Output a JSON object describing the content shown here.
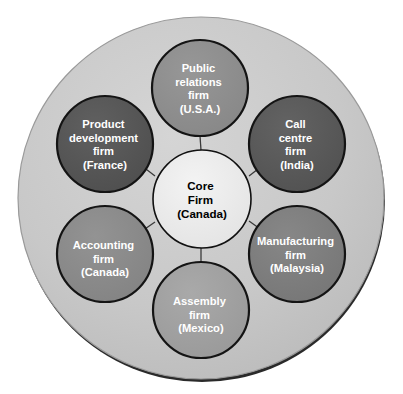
{
  "diagram": {
    "type": "hub-and-spoke-network",
    "background_color": "#ffffff",
    "outer_ring": {
      "label": "outer-boundary",
      "fill": "#c6c6c6",
      "stroke": "#1a1a1a",
      "cx": 201,
      "cy": 198,
      "r": 183
    },
    "core": {
      "id": "core-firm",
      "lines": [
        "Core",
        "Firm",
        "(Canada)"
      ],
      "fill": "#ececec",
      "stroke": "#111111",
      "text_color": "#000000",
      "cx": 202,
      "cy": 199,
      "r": 49
    },
    "satellites": [
      {
        "id": "public-relations-firm",
        "lines": [
          "Public",
          "relations",
          "firm",
          "(U.S.A.)"
        ],
        "fill": "#8e8e8e",
        "stroke": "#111111",
        "text_color": "#ffffff",
        "cx": 200,
        "cy": 88,
        "r": 48
      },
      {
        "id": "call-centre-firm",
        "lines": [
          "Call",
          "centre",
          "firm",
          "(India)"
        ],
        "fill": "#595959",
        "stroke": "#111111",
        "text_color": "#ffffff",
        "cx": 297,
        "cy": 144,
        "r": 48
      },
      {
        "id": "manufacturing-firm",
        "lines": [
          "Manufacturing",
          "firm",
          "(Malaysia)"
        ],
        "fill": "#7d7d7d",
        "stroke": "#111111",
        "text_color": "#ffffff",
        "cx": 297,
        "cy": 254,
        "r": 48
      },
      {
        "id": "assembly-firm",
        "lines": [
          "Assembly",
          "firm",
          "(Mexico)"
        ],
        "fill": "#a0a0a0",
        "stroke": "#111111",
        "text_color": "#ffffff",
        "cx": 201,
        "cy": 310,
        "r": 48
      },
      {
        "id": "accounting-firm",
        "lines": [
          "Accounting",
          "firm",
          "(Canada)"
        ],
        "fill": "#8a8a8a",
        "stroke": "#111111",
        "text_color": "#ffffff",
        "cx": 105,
        "cy": 254,
        "r": 48
      },
      {
        "id": "product-development-firm",
        "lines": [
          "Product",
          "development",
          "firm",
          "(France)"
        ],
        "fill": "#565656",
        "stroke": "#111111",
        "text_color": "#ffffff",
        "cx": 105,
        "cy": 144,
        "r": 48
      }
    ],
    "connectors": [
      {
        "id": "connector-core-public-relations",
        "x1": 200,
        "y1": 136,
        "x2": 201,
        "y2": 150
      },
      {
        "id": "connector-core-call-centre",
        "x1": 262,
        "y1": 166,
        "x2": 249,
        "y2": 176
      },
      {
        "id": "connector-core-manufacturing",
        "x1": 249,
        "y1": 221,
        "x2": 263,
        "y2": 231
      },
      {
        "id": "connector-core-assembly",
        "x1": 201,
        "y1": 248,
        "x2": 201,
        "y2": 262
      },
      {
        "id": "connector-core-accounting",
        "x1": 155,
        "y1": 222,
        "x2": 142,
        "y2": 231
      },
      {
        "id": "connector-core-product-development",
        "x1": 142,
        "y1": 166,
        "x2": 155,
        "y2": 176
      }
    ]
  }
}
